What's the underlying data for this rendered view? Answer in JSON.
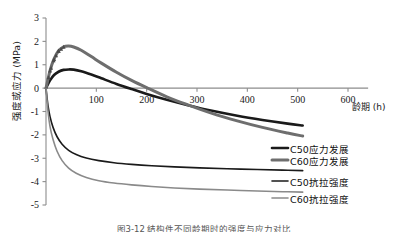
{
  "chart_data": {
    "type": "line",
    "title": "",
    "xlabel": "龄期 (h)",
    "ylabel": "强度或应力 (MPa)",
    "xlim": [
      0,
      640
    ],
    "ylim": [
      -5,
      3
    ],
    "grid": false,
    "legend_position": "right-inside",
    "xticks": [
      0,
      100,
      200,
      300,
      400,
      500,
      600
    ],
    "xtick_labels": [
      "",
      "100",
      "200",
      "300",
      "400",
      "500",
      "600"
    ],
    "yticks": [
      3,
      2,
      1,
      0,
      -1,
      -2,
      -3,
      -4,
      -5
    ],
    "ytick_labels": [
      "3",
      "2",
      "1",
      "0",
      "-1",
      "-2",
      "-3",
      "-4",
      "-5"
    ],
    "series": [
      {
        "name": "C50应力发展",
        "color": "#1a1a1a",
        "width": 2.6,
        "markers": "none",
        "x": [
          0,
          8,
          16,
          25,
          35,
          45,
          55,
          70,
          90,
          110,
          140,
          170,
          200,
          240,
          280,
          330,
          380,
          430,
          480,
          510
        ],
        "y": [
          0,
          0.33,
          0.56,
          0.7,
          0.78,
          0.8,
          0.79,
          0.72,
          0.58,
          0.42,
          0.18,
          -0.04,
          -0.25,
          -0.5,
          -0.72,
          -0.97,
          -1.18,
          -1.36,
          -1.52,
          -1.6
        ]
      },
      {
        "name": "C60应力发展",
        "color": "#6e6e6e",
        "width": 3.0,
        "markers": "triangle",
        "x": [
          0,
          8,
          16,
          25,
          35,
          45,
          55,
          70,
          90,
          110,
          140,
          170,
          200,
          240,
          280,
          330,
          380,
          430,
          480,
          510
        ],
        "y": [
          0,
          0.75,
          1.25,
          1.6,
          1.77,
          1.8,
          1.76,
          1.62,
          1.35,
          1.07,
          0.68,
          0.33,
          0.02,
          -0.37,
          -0.7,
          -1.08,
          -1.4,
          -1.68,
          -1.92,
          -2.05
        ]
      },
      {
        "name": "C50抗拉强度",
        "color": "#1a1a1a",
        "width": 1.6,
        "markers": "none",
        "x": [
          0,
          4,
          8,
          14,
          22,
          32,
          45,
          60,
          80,
          105,
          135,
          170,
          210,
          255,
          305,
          360,
          420,
          470,
          510
        ],
        "y": [
          0,
          -0.75,
          -1.22,
          -1.68,
          -2.08,
          -2.4,
          -2.66,
          -2.84,
          -2.99,
          -3.1,
          -3.19,
          -3.26,
          -3.32,
          -3.37,
          -3.41,
          -3.45,
          -3.48,
          -3.51,
          -3.53
        ]
      },
      {
        "name": "C60抗拉强度",
        "color": "#8a8a8a",
        "width": 1.6,
        "markers": "none",
        "x": [
          0,
          4,
          8,
          14,
          22,
          32,
          45,
          60,
          80,
          105,
          135,
          170,
          210,
          255,
          305,
          360,
          420,
          470,
          510
        ],
        "y": [
          0,
          -1.0,
          -1.65,
          -2.2,
          -2.7,
          -3.1,
          -3.42,
          -3.64,
          -3.82,
          -3.96,
          -4.06,
          -4.14,
          -4.21,
          -4.27,
          -4.32,
          -4.36,
          -4.4,
          -4.43,
          -4.45
        ]
      }
    ]
  },
  "axes": {
    "ylabel": "强度或应力 (MPa)",
    "xlabel": "龄期 (h)"
  },
  "legend": {
    "items": [
      {
        "label": "C50应力发展",
        "color": "#1a1a1a"
      },
      {
        "label": "C60应力发展",
        "color": "#6e6e6e"
      },
      {
        "label": "C50抗拉强度",
        "color": "#1a1a1a"
      },
      {
        "label": "C60抗拉强度",
        "color": "#8a8a8a"
      }
    ]
  },
  "caption": {
    "text": "图3-12 结构件不同龄期时的强度与应力对比"
  }
}
